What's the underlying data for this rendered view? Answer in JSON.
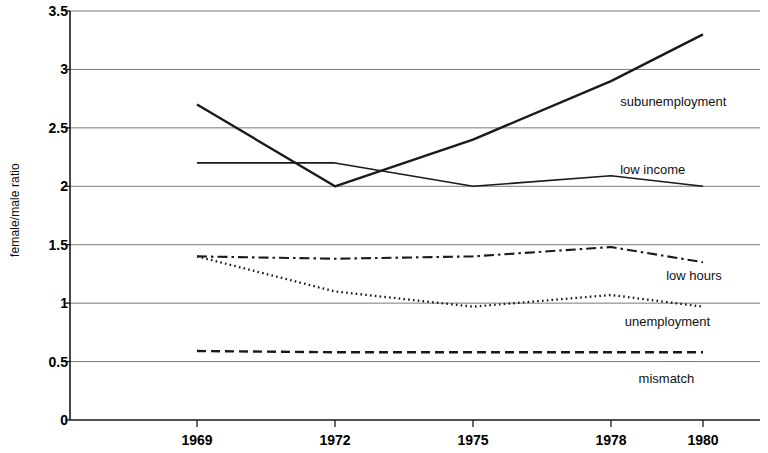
{
  "chart_data": {
    "type": "line",
    "title": "",
    "xlabel": "",
    "ylabel": "female/male ratio",
    "categories": [
      "1969",
      "1972",
      "1975",
      "1978",
      "1980"
    ],
    "x": [
      1969,
      1972,
      1975,
      1978,
      1980
    ],
    "ylim": [
      0,
      3.5
    ],
    "yticks": [
      "0",
      "0.5",
      "1",
      "1.5",
      "2",
      "2.5",
      "3",
      "3.5"
    ],
    "ytick_values": [
      0,
      0.5,
      1,
      1.5,
      2,
      2.5,
      3,
      3.5
    ],
    "grid": "horizontal",
    "legend": "inline-labels",
    "series": [
      {
        "name": "subunemployment",
        "style": "solid",
        "values": [
          2.7,
          2.0,
          2.4,
          2.9,
          3.3
        ],
        "label_x": 1978.2,
        "label_y": 2.72
      },
      {
        "name": "low income",
        "style": "solid",
        "values": [
          2.2,
          2.2,
          2.0,
          2.09,
          2.0
        ],
        "label_x": 1978.2,
        "label_y": 2.14
      },
      {
        "name": "low hours",
        "style": "dashdot",
        "values": [
          1.4,
          1.38,
          1.4,
          1.48,
          1.35
        ],
        "label_x": 1979.2,
        "label_y": 1.23
      },
      {
        "name": "unemployment",
        "style": "dotted",
        "values": [
          1.4,
          1.1,
          0.97,
          1.07,
          0.97
        ],
        "label_x": 1978.3,
        "label_y": 0.84
      },
      {
        "name": "mismatch",
        "style": "dashed",
        "values": [
          0.59,
          0.58,
          0.58,
          0.58,
          0.58
        ],
        "label_x": 1978.6,
        "label_y": 0.35
      }
    ],
    "colors": {
      "line": "#1a1a1a",
      "grid": "#7a7a7a",
      "axis": "#1a1a1a",
      "text": "#000000",
      "background": "#ffffff"
    }
  }
}
